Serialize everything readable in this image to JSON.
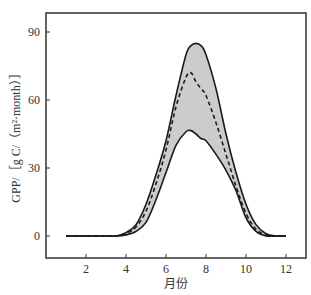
{
  "chart_data": {
    "type": "line",
    "title": "",
    "xlabel": "月份",
    "ylabel": "GPP/［g C/（m²·month）］",
    "xlim": [
      0,
      13
    ],
    "ylim": [
      -10,
      100
    ],
    "x_ticks": [
      2,
      4,
      6,
      8,
      10,
      12
    ],
    "y_ticks": [
      0,
      30,
      60,
      90
    ],
    "grid": false,
    "legend": null,
    "x": [
      1,
      2,
      3,
      3.5,
      4,
      4.5,
      5,
      5.5,
      6,
      6.5,
      7,
      7.25,
      7.5,
      7.75,
      8,
      8.5,
      9,
      9.5,
      10,
      10.5,
      11,
      11.5,
      12
    ],
    "series": [
      {
        "name": "upper-bound",
        "style": "solid",
        "values": [
          0,
          0,
          0,
          0,
          1.5,
          5,
          14,
          27,
          42,
          62,
          80,
          84,
          85,
          84,
          80,
          65,
          45,
          28,
          14,
          5,
          1,
          0,
          0
        ]
      },
      {
        "name": "mean",
        "style": "dashed",
        "values": [
          0,
          0,
          0,
          0,
          1,
          4,
          11,
          23,
          38,
          57,
          70,
          72,
          68,
          65,
          62,
          50,
          36,
          22,
          10,
          3,
          0.5,
          0,
          0
        ]
      },
      {
        "name": "lower-bound",
        "style": "solid",
        "values": [
          0,
          0,
          0,
          0,
          0.5,
          2,
          6,
          16,
          28,
          40,
          46,
          46.5,
          45,
          43,
          42,
          36,
          29,
          20,
          8,
          2,
          0,
          0,
          0
        ]
      }
    ],
    "band": {
      "between": [
        "upper-bound",
        "lower-bound"
      ],
      "fill": "#cccccc"
    }
  },
  "colors": {
    "line": "#1a1a1a",
    "band": "#cccccc",
    "frame": "#333333"
  }
}
